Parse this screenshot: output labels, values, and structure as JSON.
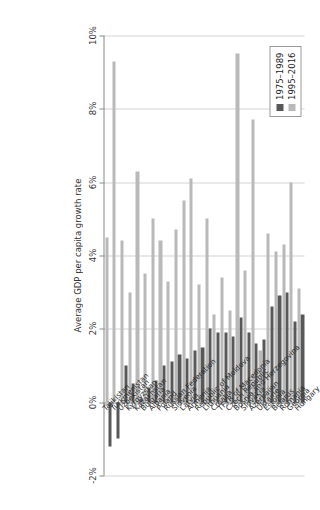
{
  "chart": {
    "type": "bar",
    "orientation": "horizontal",
    "title": "",
    "value_axis_title": "Average GDP per capita growth rate",
    "category_axis_title": "",
    "grid": true,
    "legend_position": "top-left",
    "value_ticks": [
      "10%",
      "8%",
      "6%",
      "4%",
      "2%",
      "0%",
      "-2%"
    ],
    "value_tick_numbers": [
      10,
      8,
      6,
      4,
      2,
      0,
      -2
    ],
    "vlim": [
      -2,
      10
    ]
  },
  "legend": {
    "entries": [
      {
        "label": "1975–1989",
        "color": "#585858"
      },
      {
        "label": "1995–2016",
        "color": "#b9b9b9"
      }
    ]
  },
  "chart_data": {
    "type": "bar",
    "title": "Average GDP per capita growth rate",
    "xlabel": "Average GDP per capita growth rate",
    "ylabel": "",
    "xlim": [
      -2,
      10
    ],
    "grid": true,
    "legend_position": "top-left",
    "unit": "percent",
    "tick_labels": [
      "10%",
      "8%",
      "6%",
      "4%",
      "2%",
      "0%",
      "-2%"
    ],
    "categories": [
      "Hungary",
      "Georgia",
      "Romania",
      "Belarus",
      "Estonia",
      "Ukraine",
      "Azerbaijan",
      "Slovakia",
      "Bosnia and Herzegovina",
      "Czech Republic",
      "TFYR of Macedonia",
      "Croatia",
      "Lithuania",
      "Republic of Moldova",
      "Armenia",
      "Latvia",
      "Slovenia",
      "Russian Federation",
      "Poland",
      "Albania",
      "Bulgaria",
      "Kazakhstan",
      "Kyrgyzstan",
      "Uzbekistan",
      "Turkmenistan",
      "Tajikistan"
    ],
    "series": [
      {
        "name": "1975–1989",
        "color": "#585858",
        "values": [
          2.4,
          2.2,
          3.0,
          2.9,
          2.6,
          1.7,
          1.6,
          1.9,
          2.3,
          1.8,
          1.9,
          1.9,
          2.0,
          1.5,
          1.4,
          1.2,
          1.3,
          1.1,
          1.0,
          0.6,
          0.4,
          0.1,
          0.5,
          1.0,
          -1.0,
          -1.2
        ]
      },
      {
        "name": "1995–2016",
        "color": "#b9b9b9",
        "values": [
          3.1,
          6.0,
          4.3,
          4.1,
          4.6,
          1.4,
          7.7,
          3.6,
          9.5,
          2.5,
          3.4,
          2.4,
          5.0,
          3.2,
          6.1,
          5.5,
          4.7,
          3.3,
          4.4,
          5.0,
          3.5,
          6.3,
          3.0,
          4.4,
          9.3,
          4.5
        ]
      }
    ]
  }
}
